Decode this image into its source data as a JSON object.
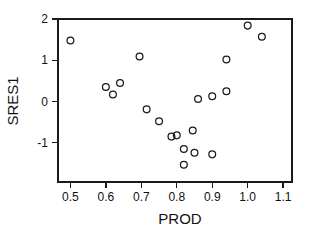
{
  "chart_data": {
    "type": "scatter",
    "title": "",
    "xlabel": "PROD",
    "ylabel": "SRES1",
    "xlim": [
      0.465,
      1.125
    ],
    "ylim": [
      -1.95,
      2.0
    ],
    "grid": false,
    "legend": null,
    "x_ticks": [
      "0.5",
      "0.6",
      "0.7",
      "0.8",
      "0.9",
      "1.0",
      "1.1"
    ],
    "x_tick_values": [
      0.5,
      0.6,
      0.7,
      0.8,
      0.9,
      1.0,
      1.1
    ],
    "y_ticks": [
      "2",
      "1",
      "0",
      "-1"
    ],
    "y_tick_values": [
      2,
      1,
      0,
      -1
    ],
    "marker": "open-circle",
    "marker_color": "#1a1a1a",
    "points": [
      {
        "x": 0.5,
        "y": 1.48
      },
      {
        "x": 0.6,
        "y": 0.35
      },
      {
        "x": 0.62,
        "y": 0.17
      },
      {
        "x": 0.64,
        "y": 0.45
      },
      {
        "x": 0.695,
        "y": 1.09
      },
      {
        "x": 0.715,
        "y": -0.19
      },
      {
        "x": 0.75,
        "y": -0.48
      },
      {
        "x": 0.785,
        "y": -0.85
      },
      {
        "x": 0.8,
        "y": -0.82
      },
      {
        "x": 0.82,
        "y": -1.15
      },
      {
        "x": 0.82,
        "y": -1.53
      },
      {
        "x": 0.845,
        "y": -0.7
      },
      {
        "x": 0.85,
        "y": -1.24
      },
      {
        "x": 0.86,
        "y": 0.06
      },
      {
        "x": 0.9,
        "y": -1.28
      },
      {
        "x": 0.9,
        "y": 0.13
      },
      {
        "x": 0.94,
        "y": 0.25
      },
      {
        "x": 0.94,
        "y": 1.02
      },
      {
        "x": 1.0,
        "y": 1.84
      },
      {
        "x": 1.04,
        "y": 1.57
      }
    ]
  },
  "axis": {
    "x_label": "PROD",
    "y_label": "SRES1"
  }
}
